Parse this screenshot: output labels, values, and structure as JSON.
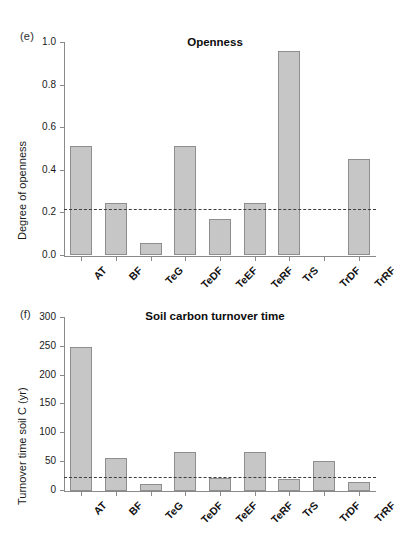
{
  "figure": {
    "background": "#ffffff",
    "bar_fill": "#c6c6c6",
    "bar_stroke": "#8e8e8e",
    "axis_color": "#8a8a8a",
    "reference_line_color": "#3d3d3d"
  },
  "panels": [
    {
      "letter": "(e)",
      "title": "Openness",
      "ylabel": "Degree of openness"
    },
    {
      "letter": "(f)",
      "title": "Soil carbon turnover time",
      "ylabel": "Turnover time soil C (yr)"
    }
  ],
  "chart_data": [
    {
      "type": "bar",
      "panel": "(e)",
      "title": "Openness",
      "xlabel": "",
      "ylabel": "Degree of openness",
      "ylim": [
        0.0,
        1.0
      ],
      "yticks": [
        0.0,
        0.2,
        0.4,
        0.6,
        0.8,
        1.0
      ],
      "ytick_labels": [
        "0.0",
        "0.2",
        "0.4",
        "0.6",
        "0.8",
        "1.0"
      ],
      "grid": false,
      "legend": "none",
      "categories": [
        "AT",
        "BF",
        "TeG",
        "TeDF",
        "TeEF",
        "TeRF",
        "TrS",
        "TrDF",
        "TrRF"
      ],
      "values": [
        0.51,
        0.245,
        0.055,
        0.51,
        0.17,
        0.245,
        0.96,
        0.0,
        0.45
      ],
      "annotations": [
        {
          "kind": "reference-line",
          "style": "dashed",
          "value": 0.215,
          "label": ""
        }
      ]
    },
    {
      "type": "bar",
      "panel": "(f)",
      "title": "Soil carbon turnover time",
      "xlabel": "",
      "ylabel": "Turnover time soil C (yr)",
      "ylim": [
        0,
        300
      ],
      "yticks": [
        0,
        50,
        100,
        150,
        200,
        250,
        300
      ],
      "ytick_labels": [
        "0",
        "50",
        "100",
        "150",
        "200",
        "250",
        "300"
      ],
      "grid": false,
      "legend": "none",
      "categories": [
        "AT",
        "BF",
        "TeG",
        "TeDF",
        "TeEF",
        "TeRF",
        "TrS",
        "TrDF",
        "TrRF"
      ],
      "values": [
        249,
        57,
        12,
        68,
        23,
        67,
        21,
        52,
        16
      ],
      "annotations": [
        {
          "kind": "reference-line",
          "style": "dashed",
          "value": 25,
          "label": ""
        }
      ]
    }
  ]
}
